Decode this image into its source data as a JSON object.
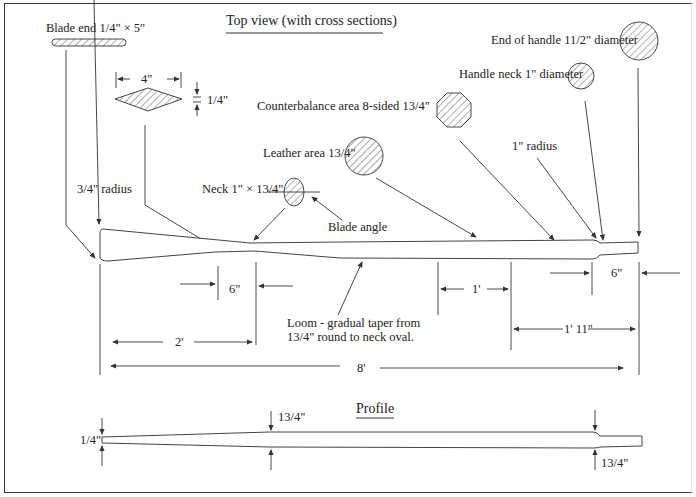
{
  "title": "Top view (with cross sections)",
  "profile_title": "Profile",
  "cross_sections": {
    "blade_end": "Blade end 1/4\" × 5\"",
    "blade_width": "4\"",
    "blade_thickness": "1/4\"",
    "neck": "Neck 1\" × 13/4\"",
    "blade_angle": "Blade angle",
    "leather_area": "Leather area 13/4\"",
    "counterbalance": "Counterbalance area 8-sided 13/4\"",
    "handle_neck": "Handle neck 1\" diameter",
    "handle_end": "End of handle 11/2\" diameter"
  },
  "callouts": {
    "blade_radius": "3/4\" radius",
    "handle_radius": "1\" radius",
    "loom_line1": "Loom - gradual taper from",
    "loom_line2": "13/4\" round to neck oval."
  },
  "dimensions": {
    "neck_length": "6\"",
    "blade_length": "2'",
    "counterbalance_length": "1'",
    "handle_section": "1' 11\"",
    "handle_length": "6\"",
    "total_length": "8'"
  },
  "profile_dims": {
    "blade_tip": "1/4\"",
    "loom_top": "13/4\"",
    "handle_bottom": "13/4\""
  }
}
